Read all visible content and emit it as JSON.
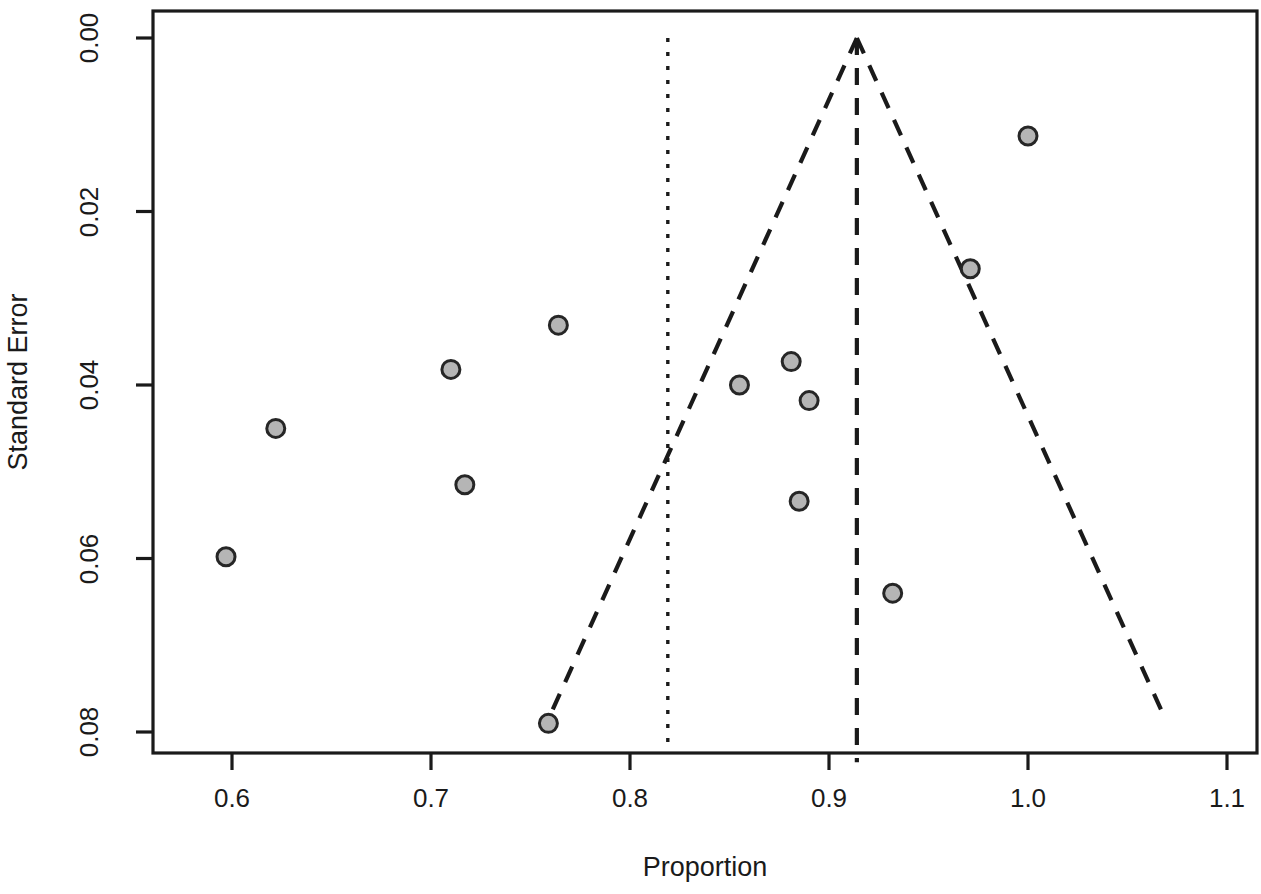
{
  "chart_data": {
    "type": "scatter",
    "title": "",
    "subtitle": "",
    "xlabel": "Proportion",
    "ylabel": "Standard Error",
    "xlim": [
      0.555,
      1.115
    ],
    "ylim": [
      0.0,
      0.0835
    ],
    "y_axis_inverted": true,
    "grid": false,
    "legend": null,
    "xticks": [
      0.6,
      0.7,
      0.8,
      0.9,
      1.0,
      1.1
    ],
    "xtick_labels": [
      "0.6",
      "0.7",
      "0.8",
      "0.9",
      "1.0",
      "1.1"
    ],
    "yticks": [
      0.0,
      0.02,
      0.04,
      0.06,
      0.08
    ],
    "ytick_labels": [
      "0.00",
      "0.02",
      "0.04",
      "0.06",
      "0.08"
    ],
    "points": [
      {
        "x": 0.597,
        "y": 0.0598
      },
      {
        "x": 0.622,
        "y": 0.045
      },
      {
        "x": 0.71,
        "y": 0.0382
      },
      {
        "x": 0.717,
        "y": 0.0515
      },
      {
        "x": 0.764,
        "y": 0.0331
      },
      {
        "x": 0.759,
        "y": 0.079
      },
      {
        "x": 0.855,
        "y": 0.04
      },
      {
        "x": 0.881,
        "y": 0.0373
      },
      {
        "x": 0.89,
        "y": 0.0418
      },
      {
        "x": 0.885,
        "y": 0.0534
      },
      {
        "x": 0.932,
        "y": 0.064
      },
      {
        "x": 0.971,
        "y": 0.0266
      },
      {
        "x": 1.0,
        "y": 0.0113
      }
    ],
    "reference_lines": [
      {
        "name": "pooled-estimate-line",
        "style": "dashed",
        "x": 0.914,
        "y_from": 0.0,
        "y_to": 0.0835
      },
      {
        "name": "null-reference-line",
        "style": "dotted",
        "x": 0.819,
        "y_from": 0.0,
        "y_to": 0.0812
      }
    ],
    "funnel": {
      "name": "pseudo-95-confidence-limits",
      "style": "dashed",
      "center": 0.914,
      "z": 1.96,
      "apex_y": 0.0,
      "base_y": 0.0785,
      "left_base_x": 0.759,
      "right_base_x": 1.069
    },
    "marker": {
      "shape": "circle",
      "fill_color": "#b5b5b5",
      "edge_color": "#262626",
      "diameter_px": 18
    },
    "frame_color": "#1a1a1a"
  },
  "axes": {
    "x_title": "Proportion",
    "y_title": "Standard Error",
    "x_tick_labels": [
      "0.6",
      "0.7",
      "0.8",
      "0.9",
      "1.0",
      "1.1"
    ],
    "y_tick_labels": [
      "0.00",
      "0.02",
      "0.04",
      "0.06",
      "0.08"
    ]
  }
}
